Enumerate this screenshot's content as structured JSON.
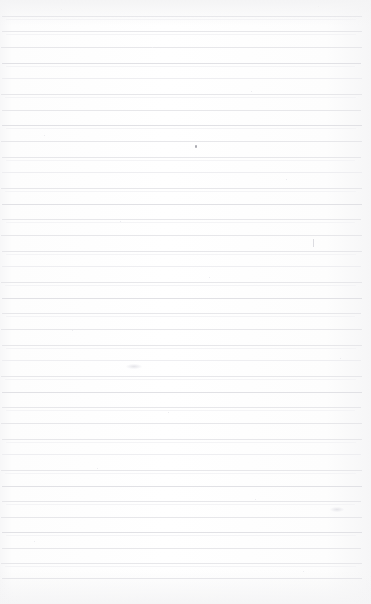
{
  "document": {
    "type": "scanned-document",
    "kind": "blank-ruled-notebook-page",
    "title": "",
    "visible_text": "",
    "orientation": "portrait",
    "page_width_px": 371,
    "page_height_px": 604
  },
  "paper": {
    "background_color": "#fdfdfd",
    "edge_shade_color": "#f5f5f6",
    "description": "blank lined paper, no handwriting or printed text"
  },
  "ruling": {
    "line_color": "#e7e7ea",
    "line_color_strong": "#e1e1e5",
    "line_color_faint": "#eeeef1",
    "line_thickness_px": 1,
    "line_spacing_px": 15.6,
    "first_line_y_px": 16,
    "line_left_x_px": 2,
    "line_right_x_px": 362,
    "line_count": 37,
    "lines": [
      {
        "y": 16,
        "weight": "strong",
        "left": 2,
        "right": 362,
        "echo": true
      },
      {
        "y": 31,
        "weight": "normal",
        "left": 2,
        "right": 362,
        "echo": true
      },
      {
        "y": 47,
        "weight": "normal",
        "left": 1,
        "right": 362,
        "echo": false
      },
      {
        "y": 63,
        "weight": "strong",
        "left": 2,
        "right": 361,
        "echo": true
      },
      {
        "y": 78,
        "weight": "faint",
        "left": 2,
        "right": 362,
        "echo": false
      },
      {
        "y": 94,
        "weight": "normal",
        "left": 1,
        "right": 362,
        "echo": true
      },
      {
        "y": 110,
        "weight": "normal",
        "left": 2,
        "right": 361,
        "echo": false
      },
      {
        "y": 125,
        "weight": "strong",
        "left": 2,
        "right": 362,
        "echo": true
      },
      {
        "y": 141,
        "weight": "normal",
        "left": 1,
        "right": 362,
        "echo": false
      },
      {
        "y": 157,
        "weight": "normal",
        "left": 2,
        "right": 361,
        "echo": true
      },
      {
        "y": 172,
        "weight": "faint",
        "left": 2,
        "right": 362,
        "echo": false
      },
      {
        "y": 188,
        "weight": "normal",
        "left": 1,
        "right": 362,
        "echo": true
      },
      {
        "y": 204,
        "weight": "strong",
        "left": 2,
        "right": 362,
        "echo": false
      },
      {
        "y": 219,
        "weight": "normal",
        "left": 2,
        "right": 361,
        "echo": true
      },
      {
        "y": 235,
        "weight": "normal",
        "left": 1,
        "right": 362,
        "echo": false
      },
      {
        "y": 251,
        "weight": "normal",
        "left": 2,
        "right": 362,
        "echo": true
      },
      {
        "y": 266,
        "weight": "faint",
        "left": 2,
        "right": 361,
        "echo": false
      },
      {
        "y": 282,
        "weight": "normal",
        "left": 1,
        "right": 362,
        "echo": true
      },
      {
        "y": 298,
        "weight": "strong",
        "left": 2,
        "right": 362,
        "echo": false
      },
      {
        "y": 313,
        "weight": "normal",
        "left": 2,
        "right": 361,
        "echo": true
      },
      {
        "y": 329,
        "weight": "normal",
        "left": 1,
        "right": 362,
        "echo": false
      },
      {
        "y": 345,
        "weight": "normal",
        "left": 2,
        "right": 362,
        "echo": true
      },
      {
        "y": 360,
        "weight": "faint",
        "left": 2,
        "right": 361,
        "echo": false
      },
      {
        "y": 376,
        "weight": "normal",
        "left": 1,
        "right": 362,
        "echo": true
      },
      {
        "y": 392,
        "weight": "strong",
        "left": 2,
        "right": 362,
        "echo": false
      },
      {
        "y": 407,
        "weight": "normal",
        "left": 2,
        "right": 361,
        "echo": true
      },
      {
        "y": 423,
        "weight": "normal",
        "left": 1,
        "right": 362,
        "echo": false
      },
      {
        "y": 439,
        "weight": "normal",
        "left": 2,
        "right": 362,
        "echo": true
      },
      {
        "y": 454,
        "weight": "faint",
        "left": 2,
        "right": 361,
        "echo": false
      },
      {
        "y": 470,
        "weight": "normal",
        "left": 1,
        "right": 362,
        "echo": true
      },
      {
        "y": 486,
        "weight": "strong",
        "left": 2,
        "right": 362,
        "echo": false
      },
      {
        "y": 501,
        "weight": "normal",
        "left": 2,
        "right": 361,
        "echo": true
      },
      {
        "y": 517,
        "weight": "normal",
        "left": 1,
        "right": 362,
        "echo": false
      },
      {
        "y": 532,
        "weight": "strong",
        "left": 2,
        "right": 362,
        "echo": true
      },
      {
        "y": 548,
        "weight": "normal",
        "left": 2,
        "right": 361,
        "echo": false
      },
      {
        "y": 563,
        "weight": "normal",
        "left": 1,
        "right": 362,
        "echo": true
      },
      {
        "y": 578,
        "weight": "strong",
        "left": 2,
        "right": 362,
        "echo": false
      }
    ]
  },
  "marks": [
    {
      "kind": "dot",
      "x": 195,
      "y": 145,
      "w": 2,
      "h": 3,
      "color": "#9a9aa2",
      "note": "small dark pen dot"
    },
    {
      "kind": "tick",
      "x": 313,
      "y": 239,
      "w": 1,
      "h": 8,
      "color": "#d8d8de",
      "note": "faint vertical pen tick"
    },
    {
      "kind": "smudge",
      "x": 126,
      "y": 364,
      "w": 16,
      "h": 5,
      "color": "#e2e2e7",
      "note": "faint break in rule line"
    },
    {
      "kind": "smudge",
      "x": 330,
      "y": 507,
      "w": 14,
      "h": 5,
      "color": "#ebebef",
      "note": "light scan blemish"
    }
  ],
  "specks": [
    {
      "x": 61,
      "y": 9
    },
    {
      "x": 318,
      "y": 6
    },
    {
      "x": 152,
      "y": 47
    },
    {
      "x": 251,
      "y": 91
    },
    {
      "x": 44,
      "y": 135
    },
    {
      "x": 286,
      "y": 179
    },
    {
      "x": 120,
      "y": 221
    },
    {
      "x": 209,
      "y": 277
    },
    {
      "x": 72,
      "y": 330
    },
    {
      "x": 340,
      "y": 358
    },
    {
      "x": 168,
      "y": 412
    },
    {
      "x": 97,
      "y": 468
    },
    {
      "x": 255,
      "y": 499
    },
    {
      "x": 34,
      "y": 541
    },
    {
      "x": 303,
      "y": 571
    }
  ]
}
